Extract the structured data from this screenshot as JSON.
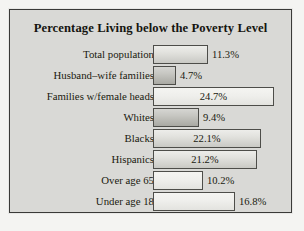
{
  "chart_data": {
    "type": "bar",
    "orientation": "horizontal",
    "title": "Percentage Living below the Poverty Level",
    "xlabel": "",
    "ylabel": "",
    "xlim": [
      0,
      28
    ],
    "grid": false,
    "legend": "none",
    "unit": "%",
    "categories": [
      "Total population",
      "Husband–wife families",
      "Families w/female heads",
      "Whites",
      "Blacks",
      "Hispanics",
      "Over age 65",
      "Under age 18"
    ],
    "values": [
      11.3,
      4.7,
      24.7,
      9.4,
      22.1,
      21.2,
      10.2,
      16.8
    ],
    "value_labels": [
      "11.3%",
      "4.7%",
      "24.7%",
      "9.4%",
      "22.1%",
      "21.2%",
      "10.2%",
      "16.8%"
    ],
    "label_placement": [
      "outside",
      "outside",
      "inside",
      "outside",
      "inside",
      "inside",
      "outside",
      "outside"
    ],
    "bar_shade": [
      "medium",
      "dark",
      "light",
      "dark",
      "medium",
      "medium",
      "light",
      "light"
    ]
  },
  "colors": {
    "page_background": "#f4f4f2",
    "panel_background": "#d9d9d6",
    "frame_border": "#3a3a38",
    "text": "#19190f",
    "bar_outline": "#4d4d49",
    "bar_fill_light": "#efefec",
    "bar_fill_medium": "#e2e2de",
    "bar_fill_dark": "#c6c6c1"
  }
}
